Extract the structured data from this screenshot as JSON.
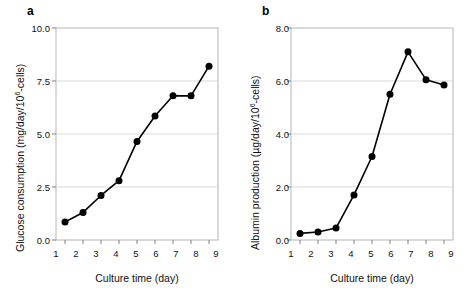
{
  "figure": {
    "panels": [
      {
        "label": "a",
        "xlabel": "Culture time (day)",
        "ylabel_prefix": "Glucose consumption (mg/day/10",
        "ylabel_sup": "6",
        "ylabel_suffix": "-cells)",
        "yticks": [
          "0.0",
          "2.5",
          "5.0",
          "7.5",
          "10.0"
        ],
        "xticks": [
          "1",
          "2",
          "3",
          "4",
          "5",
          "6",
          "7",
          "8",
          "9"
        ]
      },
      {
        "label": "b",
        "xlabel": "Culture time (day)",
        "ylabel_prefix": "Albumin production (µg/day/10",
        "ylabel_sup": "6",
        "ylabel_suffix": "-cells)",
        "yticks": [
          "0.0",
          "2.0",
          "4.0",
          "6.0",
          "8.0"
        ],
        "xticks": [
          "1",
          "2",
          "3",
          "4",
          "5",
          "6",
          "7",
          "8",
          "9"
        ]
      }
    ],
    "style": {
      "line_color": "#000000",
      "marker_color": "#000000",
      "grid_color": "#d9d9d9",
      "frame_color": "#b3b3b3",
      "background": "#ffffff"
    }
  },
  "chart_data": [
    {
      "type": "line",
      "title": "a",
      "xlabel": "Culture time (day)",
      "ylabel": "Glucose consumption (mg/day/10^6-cells)",
      "x": [
        1,
        2,
        3,
        4,
        5,
        6,
        7,
        8,
        9
      ],
      "values": [
        0.85,
        1.3,
        2.1,
        2.8,
        4.65,
        5.85,
        6.8,
        6.8,
        8.2
      ],
      "xlim": [
        0.5,
        9.5
      ],
      "ylim": [
        0,
        10
      ],
      "yticks": [
        0.0,
        2.5,
        5.0,
        7.5,
        10.0
      ],
      "xticks": [
        1,
        2,
        3,
        4,
        5,
        6,
        7,
        8,
        9
      ],
      "grid": "horizontal",
      "legend": "none",
      "marker": "filled-circle"
    },
    {
      "type": "line",
      "title": "b",
      "xlabel": "Culture time (day)",
      "ylabel": "Albumin production (µg/day/10^6-cells)",
      "x": [
        1,
        2,
        3,
        4,
        5,
        6,
        7,
        8,
        9
      ],
      "values": [
        0.25,
        0.3,
        0.45,
        1.7,
        3.15,
        5.5,
        7.1,
        6.05,
        5.85
      ],
      "xlim": [
        0.5,
        9.5
      ],
      "ylim": [
        0,
        8
      ],
      "yticks": [
        0.0,
        2.0,
        4.0,
        6.0,
        8.0
      ],
      "xticks": [
        1,
        2,
        3,
        4,
        5,
        6,
        7,
        8,
        9
      ],
      "grid": "horizontal",
      "legend": "none",
      "marker": "filled-circle"
    }
  ]
}
